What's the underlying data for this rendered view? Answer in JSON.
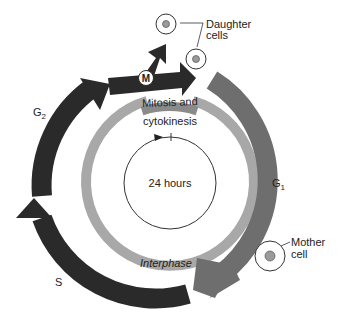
{
  "diagram": {
    "type": "cell-cycle",
    "center_label": "24 hours",
    "phases": {
      "m": {
        "label": "M"
      },
      "g1": {
        "label": "G",
        "subscript": "1"
      },
      "s": {
        "label": "S"
      },
      "g2": {
        "label": "G",
        "subscript": "2"
      }
    },
    "ring_labels": {
      "mitosis_line1": "Mitosis and",
      "mitosis_line2": "cytokinesis",
      "interphase": "Interphase"
    },
    "callouts": {
      "daughter_line1": "Daughter",
      "daughter_line2": "cells",
      "mother_line1": "Mother",
      "mother_line2": "cell"
    },
    "colors": {
      "dark_arrow": "#2a2a2a",
      "g1_arrow": "#6e6e6e",
      "inner_ring": "#a8a8a8",
      "mitosis_bar": "#8a8a8a",
      "cell_nucleus": "#9a9a9a",
      "line": "#333333"
    }
  }
}
